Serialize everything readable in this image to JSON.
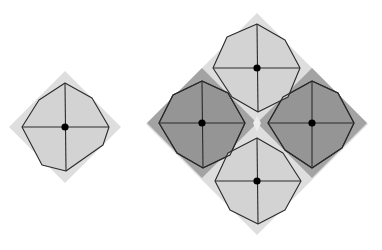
{
  "diagram": {
    "title": "",
    "colors": {
      "background": "#ffffff",
      "light_diamond": "#dedede",
      "light_octagon": "#d3d3d3",
      "dark_diamond": "#a3a3a3",
      "dark_octagon": "#959595",
      "center_gap": "#ececec",
      "stroke": "#2a2a2a",
      "dot": "#000000"
    },
    "small_figure": {
      "center": [
        65,
        127
      ],
      "diamond_half": 56,
      "octagon": [
        [
          65,
          83
        ],
        [
          92,
          98
        ],
        [
          109,
          127
        ],
        [
          103,
          145
        ],
        [
          66,
          171
        ],
        [
          42,
          165
        ],
        [
          22,
          127
        ],
        [
          39,
          100
        ]
      ],
      "shade": "light"
    },
    "large_figure": {
      "center": [
        257,
        124
      ],
      "diamond_half": 111,
      "cells": [
        {
          "name": "top",
          "center": [
            257,
            68
          ],
          "shade": "light",
          "diamond_half": 55,
          "octagon": [
            [
              257,
              24
            ],
            [
              285,
              40
            ],
            [
              300,
              68
            ],
            [
              288,
              97
            ],
            [
              258,
              112
            ],
            [
              232,
              97
            ],
            [
              213,
              68
            ],
            [
              227,
              37
            ]
          ]
        },
        {
          "name": "left",
          "center": [
            202,
            123
          ],
          "shade": "dark",
          "diamond_half": 55,
          "octagon": [
            [
              202,
              81
            ],
            [
              228,
              93
            ],
            [
              245,
              123
            ],
            [
              230,
              155
            ],
            [
              203,
              168
            ],
            [
              177,
              153
            ],
            [
              159,
              123
            ],
            [
              173,
              95
            ]
          ]
        },
        {
          "name": "right",
          "center": [
            312,
            123
          ],
          "shade": "dark",
          "diamond_half": 55,
          "octagon": [
            [
              312,
              81
            ],
            [
              338,
              93
            ],
            [
              354,
              123
            ],
            [
              342,
              148
            ],
            [
              312,
              168
            ],
            [
              285,
              150
            ],
            [
              268,
              123
            ],
            [
              283,
              97
            ]
          ]
        },
        {
          "name": "bottom",
          "center": [
            257,
            181
          ],
          "shade": "light",
          "diamond_half": 55,
          "octagon": [
            [
              257,
              138
            ],
            [
              283,
              153
            ],
            [
              301,
              181
            ],
            [
              285,
              210
            ],
            [
              258,
              224
            ],
            [
              230,
              210
            ],
            [
              215,
              181
            ],
            [
              228,
              153
            ]
          ]
        }
      ]
    }
  }
}
